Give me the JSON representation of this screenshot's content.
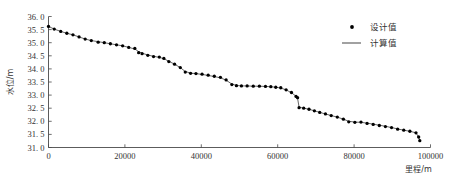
{
  "chart_data": {
    "type": "scatter",
    "title": "",
    "xlabel": "里程/m",
    "ylabel": "水位/m",
    "xlim": [
      0,
      100000
    ],
    "ylim": [
      31.0,
      36.0
    ],
    "xticks": [
      0,
      20000,
      40000,
      60000,
      80000,
      100000
    ],
    "xtick_labels": [
      "0",
      "20000",
      "40000",
      "60000",
      "80000",
      "100000"
    ],
    "yticks": [
      31.0,
      31.5,
      32.0,
      32.5,
      33.0,
      33.5,
      34.0,
      34.5,
      35.0,
      35.5,
      36.0
    ],
    "ytick_labels": [
      "31. 0",
      "31. 5",
      "32. 0",
      "32. 5",
      "33. 0",
      "33. 5",
      "34. 0",
      "34. 5",
      "35. 0",
      "35. 5",
      "36. 0"
    ],
    "grid": false,
    "legend_position": "top-right",
    "series": [
      {
        "name": "设计值",
        "marker": "circle",
        "color": "#000000",
        "x": [
          0,
          1500,
          3200,
          4800,
          6400,
          8000,
          9600,
          11200,
          13000,
          14600,
          16200,
          17800,
          19400,
          21000,
          22600,
          23600,
          24500,
          26000,
          27500,
          29000,
          30200,
          31500,
          33000,
          34500,
          35800,
          37200,
          38600,
          40200,
          41800,
          43400,
          45000,
          46500,
          48000,
          49200,
          50500,
          52000,
          53600,
          55200,
          56800,
          58200,
          59500,
          60800,
          62200,
          63600,
          64800,
          65200,
          65600,
          66800,
          68200,
          69600,
          71000,
          72500,
          74000,
          75600,
          77200,
          78600,
          80200,
          81800,
          83400,
          85000,
          86600,
          88200,
          89800,
          91400,
          93000,
          94600,
          96200,
          96900,
          97200
        ],
        "y": [
          35.62,
          35.52,
          35.43,
          35.36,
          35.3,
          35.22,
          35.14,
          35.08,
          35.02,
          35.0,
          34.96,
          34.92,
          34.88,
          34.82,
          34.78,
          34.62,
          34.58,
          34.52,
          34.47,
          34.45,
          34.4,
          34.28,
          34.18,
          34.05,
          33.88,
          33.83,
          33.82,
          33.8,
          33.76,
          33.72,
          33.68,
          33.58,
          33.4,
          33.36,
          33.35,
          33.35,
          33.34,
          33.34,
          33.33,
          33.32,
          33.3,
          33.28,
          33.2,
          33.1,
          32.95,
          32.9,
          32.52,
          32.5,
          32.46,
          32.4,
          32.34,
          32.28,
          32.22,
          32.16,
          32.08,
          31.98,
          31.96,
          31.97,
          31.92,
          31.88,
          31.84,
          31.8,
          31.76,
          31.7,
          31.66,
          31.62,
          31.56,
          31.4,
          31.26
        ]
      },
      {
        "name": "计算值",
        "marker": "line",
        "color": "#555555",
        "x": [
          0,
          1500,
          3200,
          4800,
          6400,
          8000,
          9600,
          11200,
          13000,
          14600,
          16200,
          17800,
          19400,
          21000,
          22600,
          23600,
          24500,
          26000,
          27500,
          29000,
          30200,
          31500,
          33000,
          34500,
          35800,
          37200,
          38600,
          40200,
          41800,
          43400,
          45000,
          46500,
          48000,
          49200,
          50500,
          52000,
          53600,
          55200,
          56800,
          58200,
          59500,
          60800,
          62200,
          63600,
          64800,
          65200,
          65600,
          66800,
          68200,
          69600,
          71000,
          72500,
          74000,
          75600,
          77200,
          78600,
          80200,
          81800,
          83400,
          85000,
          86600,
          88200,
          89800,
          91400,
          93000,
          94600,
          96200,
          96900,
          97200
        ],
        "y": [
          35.62,
          35.52,
          35.43,
          35.36,
          35.3,
          35.22,
          35.14,
          35.08,
          35.04,
          35.0,
          34.96,
          34.92,
          34.88,
          34.82,
          34.76,
          34.66,
          34.6,
          34.53,
          34.48,
          34.44,
          34.39,
          34.29,
          34.18,
          34.05,
          33.9,
          33.84,
          33.82,
          33.79,
          33.75,
          33.71,
          33.66,
          33.57,
          33.42,
          33.37,
          33.35,
          33.35,
          33.34,
          33.34,
          33.33,
          33.32,
          33.3,
          33.27,
          33.2,
          33.09,
          32.96,
          32.88,
          32.54,
          32.5,
          32.46,
          32.4,
          32.34,
          32.28,
          32.22,
          32.16,
          32.08,
          32.0,
          31.97,
          31.96,
          31.93,
          31.89,
          31.85,
          31.81,
          31.76,
          31.71,
          31.66,
          31.62,
          31.56,
          31.4,
          31.26
        ]
      }
    ]
  },
  "legend": {
    "entries": [
      {
        "label": "设计值",
        "symbol": "dot"
      },
      {
        "label": "计算值",
        "symbol": "line"
      }
    ]
  },
  "axes": {
    "x_title": "里程/m",
    "y_title": "水位/m"
  }
}
